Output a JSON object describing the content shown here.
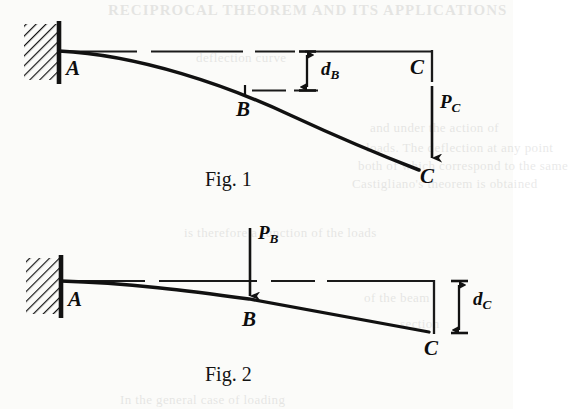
{
  "page": {
    "width": 513,
    "height": 409,
    "background_color": "#fbfbf9",
    "ink_color": "#111111"
  },
  "figures": [
    {
      "id": "fig-1",
      "caption": "Fig. 1",
      "description": "Cantilever beam AC fixed at A, deflected downward by a point load P sub C applied at the free end C; deflection d sub B measured at mid-point B.",
      "support": {
        "type": "fixed-wall-hatched",
        "label": "A"
      },
      "points": [
        {
          "name": "A",
          "label": "A",
          "role": "fixed-end"
        },
        {
          "name": "B",
          "label": "B",
          "role": "mid-span"
        },
        {
          "name": "C_undeflected",
          "label": "C",
          "role": "undeflected-free-end"
        },
        {
          "name": "C_deflected",
          "label": "C",
          "role": "deflected-free-end"
        }
      ],
      "load": {
        "name": "P_C",
        "symbol": "P",
        "subscript": "C",
        "direction": "down",
        "applied_at": "C"
      },
      "dimension": {
        "name": "d_B",
        "symbol": "d",
        "subscript": "B",
        "measured_at": "B",
        "type": "vertical-deflection"
      }
    },
    {
      "id": "fig-2",
      "caption": "Fig. 2",
      "description": "Cantilever beam AC fixed at A, loaded by point load P sub B at mid-point B; resulting free-end deflection d sub C measured at C.",
      "support": {
        "type": "fixed-wall-hatched",
        "label": "A"
      },
      "points": [
        {
          "name": "A",
          "label": "A",
          "role": "fixed-end"
        },
        {
          "name": "B",
          "label": "B",
          "role": "mid-span"
        },
        {
          "name": "C",
          "label": "C",
          "role": "deflected-free-end"
        }
      ],
      "load": {
        "name": "P_B",
        "symbol": "P",
        "subscript": "B",
        "direction": "down",
        "applied_at": "B"
      },
      "dimension": {
        "name": "d_C",
        "symbol": "d",
        "subscript": "C",
        "measured_at": "C",
        "type": "vertical-deflection"
      }
    }
  ],
  "labels": {
    "A": "A",
    "B": "B",
    "C": "C",
    "d": "d",
    "P": "P",
    "sub_B": "B",
    "sub_C": "C",
    "fig1_caption": "Fig. 1",
    "fig2_caption": "Fig. 2"
  },
  "background_showthrough": [
    {
      "text": "RECIPROCAL THEOREM AND ITS APPLICATIONS",
      "x": 108,
      "y": 2
    },
    {
      "text": "deflection curve",
      "x": 196,
      "y": 50
    },
    {
      "text": "and under the action of",
      "x": 370,
      "y": 120
    },
    {
      "text": "loads. The deflection at any point",
      "x": 366,
      "y": 140
    },
    {
      "text": "both of which correspond to the same",
      "x": 358,
      "y": 158
    },
    {
      "text": "Castigliano's theorem is obtained",
      "x": 352,
      "y": 176
    },
    {
      "text": "is therefore a function of the loads",
      "x": 184,
      "y": 225
    },
    {
      "text": "of the beam",
      "x": 364,
      "y": 290
    },
    {
      "text": "section",
      "x": 400,
      "y": 316
    },
    {
      "text": "In the general case of loading",
      "x": 120,
      "y": 396
    }
  ]
}
